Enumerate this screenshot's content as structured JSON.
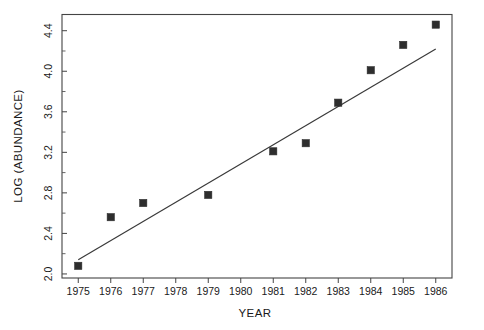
{
  "chart_data": {
    "type": "scatter",
    "title": "",
    "xlabel": "YEAR",
    "ylabel": "LOG (ABUNDANCE)",
    "xlim": [
      1974.5,
      1986.5
    ],
    "ylim": [
      1.96,
      4.56
    ],
    "grid": false,
    "legend": null,
    "x": [
      1975,
      1976,
      1977,
      1979,
      1981,
      1982,
      1983,
      1984,
      1985,
      1986
    ],
    "y": [
      2.08,
      2.56,
      2.7,
      2.78,
      3.21,
      3.29,
      3.69,
      4.01,
      4.26,
      4.46
    ],
    "points": [
      {
        "year": 1975,
        "log_abundance": 2.08
      },
      {
        "year": 1976,
        "log_abundance": 2.56
      },
      {
        "year": 1977,
        "log_abundance": 2.7
      },
      {
        "year": 1979,
        "log_abundance": 2.78
      },
      {
        "year": 1981,
        "log_abundance": 3.21
      },
      {
        "year": 1982,
        "log_abundance": 3.29
      },
      {
        "year": 1983,
        "log_abundance": 3.69
      },
      {
        "year": 1984,
        "log_abundance": 4.01
      },
      {
        "year": 1985,
        "log_abundance": 4.26
      },
      {
        "year": 1986,
        "log_abundance": 4.46
      }
    ],
    "series": [
      {
        "name": "log abundance",
        "type": "scatter",
        "marker": "filled-square",
        "color": "#2e2e2e",
        "values": [
          2.08,
          2.56,
          2.7,
          2.78,
          3.21,
          3.29,
          3.69,
          4.01,
          4.26,
          4.46
        ]
      },
      {
        "name": "regression line",
        "type": "line",
        "color": "#3a3a3a",
        "endpoints": [
          {
            "x": 1975,
            "y": 2.14
          },
          {
            "x": 1986,
            "y": 4.22
          }
        ]
      }
    ],
    "xticks": [
      1975,
      1976,
      1977,
      1978,
      1979,
      1980,
      1981,
      1982,
      1983,
      1984,
      1985,
      1986
    ],
    "xticklabels": [
      "1975",
      "1976",
      "1977",
      "1978",
      "1979",
      "1980",
      "1981",
      "1982",
      "1983",
      "1984",
      "1985",
      "1986"
    ],
    "yticks": [
      2.0,
      2.4,
      2.8,
      3.2,
      3.6,
      4.0,
      4.4
    ],
    "yticklabels": [
      "2.0",
      "2.4",
      "2.8",
      "3.2",
      "3.6",
      "4.0",
      "4.4"
    ],
    "yticks_minor": [
      2.2,
      2.6,
      3.0,
      3.4,
      3.8,
      4.2
    ],
    "background_color": "#ffffff",
    "frame_color": "#444444"
  }
}
